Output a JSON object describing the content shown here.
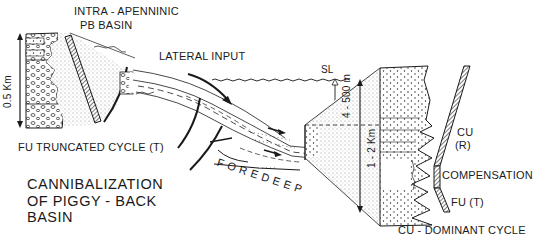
{
  "diagram": {
    "title_lines": [
      "CANNIBALIZATION",
      "OF PIGGY - BACK",
      "BASIN"
    ],
    "labels": {
      "intra_apenninic": "INTRA - APENNINIC",
      "pb_basin": "PB BASIN",
      "lateral_input": "LATERAL INPUT",
      "sea_level": "SL",
      "depth_range": "4 - 500 m",
      "left_scale": "0.5 Km",
      "right_scale": "1 - 2 Km",
      "fu_truncated_cycle": "FU TRUNCATED CYCLE (T)",
      "foredeep": "FOREDEEP",
      "cu_dominant_cycle": "CU - DOMINANT CYCLE",
      "cu": "CU",
      "r": "(R)",
      "compensation": "COMPENSATION",
      "fu_t": "FU   (T)"
    },
    "colors": {
      "ink": "#1a1a1a",
      "stipple": "#bdbdbd",
      "background": "#ffffff"
    }
  }
}
